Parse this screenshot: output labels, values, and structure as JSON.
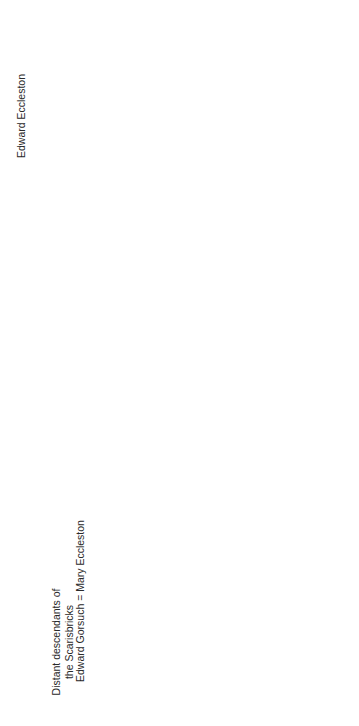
{
  "orientation": "rotated 90° counter-clockwise",
  "nodes": {
    "distant": {
      "lines": [
        "Distant descendants of",
        "the Scarisbricks"
      ]
    },
    "edward_eccleston": {
      "lines": [
        "Edward Eccleston"
      ]
    },
    "edward_gorsuch_mary": {
      "lines": [
        "Edward Gorsuch = Mary Eccleston"
      ]
    },
    "thomas_eccleston_1612": {
      "lines": [
        "Thomas Eccleston",
        "1612–1646"
      ]
    },
    "robert_blundell": {
      "lines": [
        "Robert Blundell",
        "of Ince Blundell",
        "d. 1657"
      ]
    },
    "edward_scarisbrick": {
      "lines": [
        "Edward Scarisbrick =Frances Bradshaigh",
        "of Scarisbrick                of Haigh",
        "d. 1653"
      ]
    },
    "james_gorsuch": {
      "lines": [
        "James Gorsuch"
      ]
    },
    "henry_eleanor": {
      "lines": [
        "Henry Eccleston = Eleanor Blundell"
      ]
    },
    "frances_james": {
      "lines": [
        "Frances Blundell = James Scarisbrick",
        "1635–1673"
      ]
    },
    "thomas_no_issue": {
      "lines": [
        "Thomas",
        "no issue"
      ]
    },
    "john_winifred": {
      "lines": [
        "John = Winifred Lowe",
        "d. 1742        d. 1793"
      ]
    },
    "george": {
      "lines": [
        "George",
        "no issue"
      ]
    },
    "james_priest": {
      "lines": [
        "James",
        "(priest)"
      ]
    },
    "thomas_eccleston_1659": {
      "lines": [
        "Thomas Eccleston",
        "1659–1743"
      ]
    },
    "edward_1644": {
      "lines": [
        "Edward",
        "1644–1711"
      ]
    },
    "joseph_1673": {
      "lines": [
        "Joseph",
        "d. 1673"
      ]
    },
    "robert_ann": {
      "lines": [
        "Robert = Ann Messenger",
        "1682–1737   of Fountains Abbey, Yorkshire"
      ]
    },
    "children": [
      {
        "lines": [
          "James"
        ]
      },
      {
        "lines": [
          "Edward",
          "c. 1697–",
          "1778"
        ]
      },
      {
        "lines": [
          "Robert"
        ]
      },
      {
        "lines": [
          "William",
          "d. 1767"
        ]
      },
      {
        "lines": [
          "Francis"
        ]
      },
      {
        "lines": [
          "Joseph",
          "b. c. 1708"
        ]
      },
      {
        "lines": [
          "Henry",
          "b. c. 1711"
        ]
      },
      {
        "lines": [
          "Basil",
          "Thomas",
          "1712–1789"
        ]
      },
      {
        "lines": [
          "= Elizabeth",
          "Dicconson",
          "d. 1753"
        ]
      },
      {
        "lines": [
          "? John"
        ]
      },
      {
        "lines": [
          "Ann",
          "d. c. 1732/3"
        ]
      },
      {
        "lines": [
          "Frances",
          "d. c. 1735/6"
        ]
      },
      {
        "lines": [
          "Ann",
          "(Palmes)",
          "d. 1787"
        ]
      },
      {
        "lines": [
          "Mary",
          "d. c. 1790"
        ]
      }
    ],
    "ann_1750": {
      "lines": [
        "Ann",
        "1750–1801"
      ]
    },
    "thomas_eleanor": {
      "lines": [
        "Thomas = Eleanor Clifton",
        "1752–1809"
      ]
    },
    "elizabeth_infancy": {
      "lines": [
        "Elizabeth",
        "died in infancy"
      ]
    }
  }
}
